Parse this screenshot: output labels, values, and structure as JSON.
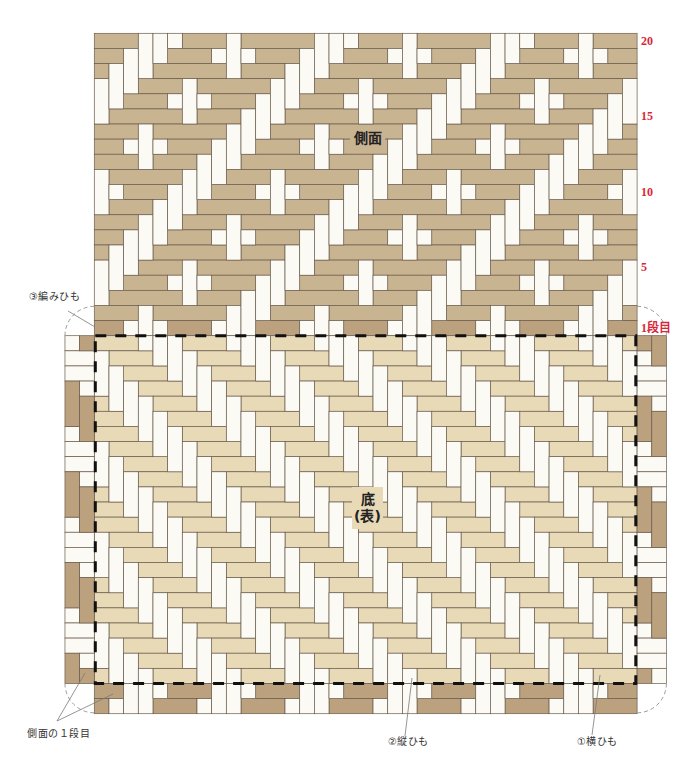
{
  "labels": {
    "side": "側面",
    "base_line1": "底",
    "base_line2": "(表)",
    "weaving_strip": "③編みひも",
    "side_first_row": "側面の１段目",
    "vertical_strip": "②縦ひも",
    "horizontal_strip": "①横ひも"
  },
  "row_markers": [
    {
      "label": "20",
      "row": 20
    },
    {
      "label": "15",
      "row": 15
    },
    {
      "label": "10",
      "row": 10
    },
    {
      "label": "5",
      "row": 5
    },
    {
      "label": "1段目",
      "row": 1
    }
  ],
  "colors": {
    "side_strip": "#c9b492",
    "first_row_strip": "#bca17e",
    "base_strip": "#e8d9b7",
    "standing_strip": "#fcfaf4",
    "outline": "#6a5c4c",
    "marker_red": "#d9263a",
    "dashed_outline": "#111111",
    "fold_arc": "#9a9a9a",
    "leader_line": "#7a7a7a"
  },
  "weave": {
    "columns": 37,
    "side": {
      "rows": 20,
      "highlight_first_row": true,
      "tile": [
        "HHHVVVHHHVHH",
        "HHVVVHHHVVVH",
        "HVVVHHHHHVHH",
        "VVVHHHVHHHHH",
        "VVHHHVVVHHHV",
        "VHHHHHVHHHVV",
        "HHHVHHHHHVVV",
        "HHVVVHHHVVVH",
        "HHHVHHHVVVHH",
        "VHHHHHVVVHHH",
        "VVHHHVVVHHHV",
        "VHHHVVVHHHHH"
      ]
    },
    "base": {
      "rows": 23,
      "twill": {
        "a": 1,
        "b": -1,
        "k": 0,
        "period": 6,
        "span": 3,
        "true_means": "horizontal"
      },
      "horizontal_color": "#e8d9b7",
      "vertical_color": "#fcfaf4"
    },
    "left_extension": {
      "columns": [
        -2,
        -1
      ],
      "rows": 23,
      "twill": {
        "a": 1,
        "b": -1,
        "k": 1,
        "period": 6,
        "span": 3,
        "true_means": "vertical"
      },
      "horizontal_color": "#fcfaf4",
      "vertical_color": "#bca17e"
    },
    "right_extension": {
      "columns": [
        37,
        38
      ],
      "rows": 23,
      "twill": {
        "a": 1,
        "b": -1,
        "k": -1,
        "period": 6,
        "span": 3,
        "true_means": "vertical"
      },
      "horizontal_color": "#fcfaf4",
      "vertical_color": "#bca17e"
    },
    "bottom_extension": {
      "row_start": 23,
      "rows": 2,
      "twill": {
        "a": 1,
        "b": 1,
        "k": 2,
        "period": 6,
        "span": 3,
        "true_means": "horizontal"
      },
      "horizontal_color": "#bca17e",
      "vertical_color": "#fcfaf4"
    }
  }
}
